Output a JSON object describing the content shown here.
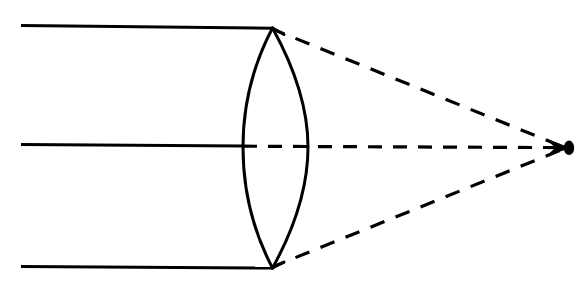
{
  "figure": {
    "background_color": "#ffffff",
    "ink_color": "#000000",
    "width": 587,
    "height": 300,
    "ghost_artifact_color": "#e9e9e9",
    "ghost_artifact_text": "scanned page bleed-through"
  },
  "optics": {
    "lens_type": "biconvex",
    "lens_center_x": 275,
    "lens_top_vertex": {
      "x": 272,
      "y": 28
    },
    "lens_bottom_vertex": {
      "x": 272,
      "y": 268
    },
    "lens_left_surface_x_at_axis": 243,
    "lens_right_surface_x_at_axis": 308,
    "optical_axis_y": 147,
    "focal_point": {
      "x": 568,
      "y": 148
    },
    "focal_point_marker": "filled-arrowhead",
    "incoming_rays_start_x": 21,
    "incoming_ray_count": 3,
    "incoming_rays": [
      {
        "name": "upper-parallel-ray",
        "y_start": 25,
        "y_end": 28,
        "style": "solid"
      },
      {
        "name": "axial-parallel-ray",
        "y_start": 144,
        "y_end": 146,
        "style": "solid"
      },
      {
        "name": "lower-parallel-ray",
        "y_start": 266,
        "y_end": 268,
        "style": "solid"
      }
    ],
    "refracted_rays": [
      {
        "name": "upper-refracted-ray",
        "from": {
          "x": 272,
          "y": 28
        },
        "to": {
          "x": 566,
          "y": 147
        },
        "style": "dashed"
      },
      {
        "name": "axial-refracted-ray",
        "from": {
          "x": 243,
          "y": 146
        },
        "to": {
          "x": 566,
          "y": 147
        },
        "style": "dashed"
      },
      {
        "name": "lower-refracted-ray",
        "from": {
          "x": 272,
          "y": 268
        },
        "to": {
          "x": 566,
          "y": 149
        },
        "style": "dashed"
      }
    ],
    "line_weights": {
      "ray_solid": 3.0,
      "ray_dashed": 3.2,
      "lens_outline": 3.0
    },
    "dash_pattern": {
      "dash": 14,
      "gap": 11
    }
  }
}
